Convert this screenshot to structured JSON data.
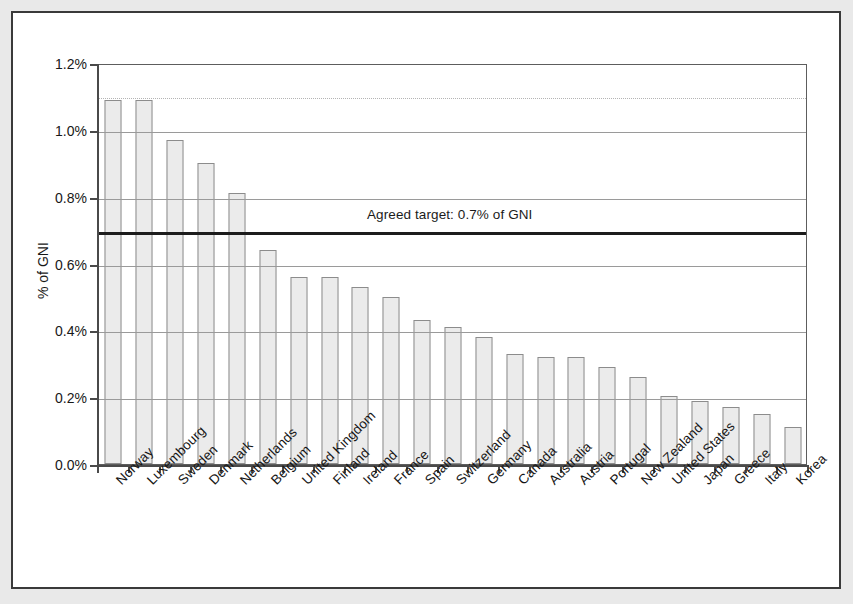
{
  "chart_data": {
    "type": "bar",
    "title": "",
    "xlabel": "",
    "ylabel": "% of GNI",
    "ylim": [
      0,
      1.2
    ],
    "ytick_labels": [
      "0.0%",
      "0.2%",
      "0.4%",
      "0.6%",
      "0.8%",
      "1.0%",
      "1.2%"
    ],
    "ytick_values": [
      0.0,
      0.2,
      0.4,
      0.6,
      0.8,
      1.0,
      1.2
    ],
    "grid": true,
    "legend": "none",
    "unit": "percent of GNI",
    "categories": [
      "Norway",
      "Luxembourg",
      "Sweden",
      "Denmark",
      "Netherlands",
      "Belgium",
      "United Kingdom",
      "Finland",
      "Ireland",
      "France",
      "Spain",
      "Switzerland",
      "Germany",
      "Canada",
      "Australia",
      "Austria",
      "Portugal",
      "New Zealand",
      "United States",
      "Japan",
      "Greece",
      "Italy",
      "Korea"
    ],
    "values": [
      1.09,
      1.09,
      0.97,
      0.9,
      0.81,
      0.64,
      0.56,
      0.56,
      0.53,
      0.5,
      0.43,
      0.41,
      0.38,
      0.33,
      0.32,
      0.32,
      0.29,
      0.26,
      0.205,
      0.19,
      0.17,
      0.15,
      0.11
    ],
    "annotations": [
      {
        "name": "agreed-target",
        "label": "Agreed target: 0.7% of GNI",
        "value": 0.7,
        "type": "horizontal-line",
        "color": "#1c1c1c"
      }
    ],
    "colors": {
      "bar_fill": "#ebebeb",
      "bar_stroke": "#8c8c8c",
      "axis": "#4a4a4a",
      "gridline": "#9a9a9a",
      "target_line": "#1c1c1c",
      "frame": "#3a3a3a",
      "page_background": "#e9e9e9",
      "plot_background": "#ffffff"
    }
  }
}
